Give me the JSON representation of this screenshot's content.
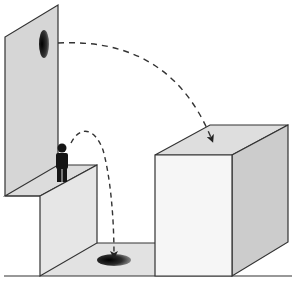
{
  "diagram": {
    "colors": {
      "background": "#ffffff",
      "wall_fill": "#d6d6d6",
      "ledge_top": "#dcdcdc",
      "ledge_front": "#e4e4e4",
      "ledge_side": "#cfcfcf",
      "floor": "#e2e2e2",
      "box_front": "#f6f6f6",
      "box_top": "#dedede",
      "box_side": "#cccccc",
      "outline": "#333333",
      "figure": "#151515",
      "portal_dark": "#111111",
      "portal_light": "#8a8a8a",
      "trajectory": "#333333"
    },
    "elements": [
      {
        "id": "wall",
        "label": "tall wall"
      },
      {
        "id": "wall-portal",
        "label": "wall portal (exit)"
      },
      {
        "id": "ledge",
        "label": "raised ledge"
      },
      {
        "id": "person",
        "label": "person figure"
      },
      {
        "id": "floor-portal",
        "label": "floor portal (entry)"
      },
      {
        "id": "box",
        "label": "tall box"
      },
      {
        "id": "trajectory-fall",
        "label": "dashed path into floor portal"
      },
      {
        "id": "trajectory-exit",
        "label": "dashed path from wall portal onto box"
      }
    ]
  }
}
